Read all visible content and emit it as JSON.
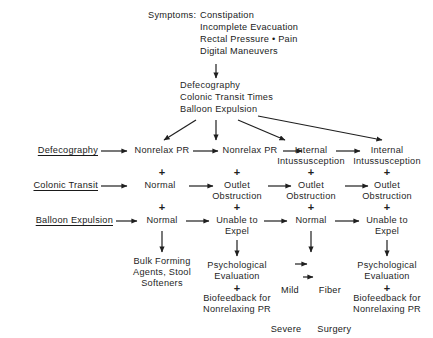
{
  "figure": {
    "type": "clinical-algorithm-flowchart",
    "title_visible": false,
    "ink_color": "#1f1f1f",
    "background_color": "#ffffff"
  },
  "symptoms_block": {
    "label": "Symptoms:",
    "items": [
      "Constipation",
      "Incomplete Evacuation",
      "Rectal Pressure • Pain",
      "Digital Maneuvers"
    ]
  },
  "tests_block": {
    "items": [
      "Defecography",
      "Colonic Transit Times",
      "Balloon Expulsion"
    ]
  },
  "stage_labels": [
    "Defecography",
    "Colonic Transit",
    "Balloon Expulsion"
  ],
  "columns": [
    {
      "defecography": "Nonrelax PR",
      "colonic_transit": "Normal",
      "balloon_expulsion": "Normal",
      "treatment": "Bulk Forming\nAgents, Stool\nSofteners"
    },
    {
      "defecography": "Nonrelax PR",
      "colonic_transit": "Outlet\nObstruction",
      "balloon_expulsion": "Unable to\nExpel",
      "treatment": "Psychological\nEvaluation",
      "treatment_plus": "+",
      "treatment_extra": "Biofeedback for\nNonrelaxing PR"
    },
    {
      "defecography": "Internal\nIntussusception",
      "colonic_transit": "Outlet\nObstruction",
      "balloon_expulsion": "Normal",
      "treatment_rows": [
        {
          "severity": "Mild",
          "therapy": "Fiber"
        },
        {
          "severity": "Severe",
          "therapy": "Surgery"
        }
      ]
    },
    {
      "defecography": "Internal\nIntussusception",
      "colonic_transit": "Outlet\nObstruction",
      "balloon_expulsion": "Unable to\nExpel",
      "treatment": "Psychological\nEvaluation",
      "treatment_plus": "+",
      "treatment_extra": "Biofeedback for\nNonrelaxing PR"
    }
  ],
  "plus_signs": {
    "row1_to_row2": [
      "+",
      "+",
      "+",
      "+"
    ],
    "row2_to_row3": [
      "+",
      "+",
      "+",
      "+"
    ]
  }
}
